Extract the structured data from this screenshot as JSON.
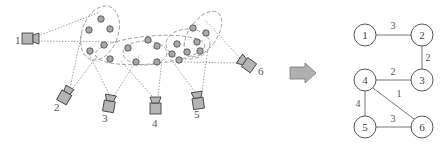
{
  "colors": {
    "line": "#777777",
    "dotted": "#888888",
    "dashed": "#999999",
    "point_fill": "#a8a8a8",
    "point_stroke": "#555555",
    "camera_fill": "#b4b4b4",
    "camera_stroke": "#444444",
    "arrow_fill": "#b0b0b0",
    "node_stroke": "#444444"
  },
  "scene": {
    "cameras": [
      {
        "id": "1",
        "label": "1"
      },
      {
        "id": "2",
        "label": "2"
      },
      {
        "id": "3",
        "label": "3"
      },
      {
        "id": "4",
        "label": "4"
      },
      {
        "id": "5",
        "label": "5"
      },
      {
        "id": "6",
        "label": "6"
      }
    ]
  },
  "graph": {
    "nodes": [
      {
        "id": "1",
        "label": "1"
      },
      {
        "id": "2",
        "label": "2"
      },
      {
        "id": "3",
        "label": "3"
      },
      {
        "id": "4",
        "label": "4"
      },
      {
        "id": "5",
        "label": "5"
      },
      {
        "id": "6",
        "label": "6"
      }
    ],
    "edges": [
      {
        "from": "1",
        "to": "2",
        "weight": "3"
      },
      {
        "from": "2",
        "to": "3",
        "weight": "2"
      },
      {
        "from": "4",
        "to": "3",
        "weight": "2"
      },
      {
        "from": "4",
        "to": "6",
        "weight": "1"
      },
      {
        "from": "4",
        "to": "5",
        "weight": "4"
      },
      {
        "from": "5",
        "to": "6",
        "weight": "3"
      }
    ]
  }
}
